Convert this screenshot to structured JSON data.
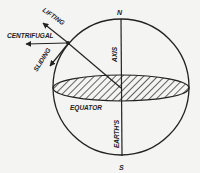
{
  "diagram": {
    "labels": {
      "north": "N",
      "south": "S",
      "axis": "AXIS",
      "earths": "EARTH'S",
      "equator": "EQUATOR",
      "lifting": "LIFTING",
      "centrifugal": "CENTRIFUGAL",
      "sliding": "SLIDING"
    },
    "colors": {
      "ink": "#222222",
      "background": "#f4f4f2"
    }
  }
}
